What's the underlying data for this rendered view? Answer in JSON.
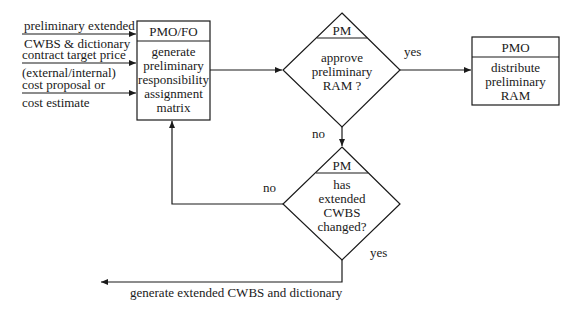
{
  "inputs": [
    {
      "line1": "preliminary extended",
      "line2": "CWBS & dictionary"
    },
    {
      "line1": "contract target price",
      "line2": "(external/internal)"
    },
    {
      "line1": "cost proposal or",
      "line2": "cost estimate"
    }
  ],
  "process_generate": {
    "actor": "PMO/FO",
    "lines": [
      "generate",
      "preliminary",
      "responsibility",
      "assignment",
      "matrix"
    ]
  },
  "decision_approve": {
    "actor": "PM",
    "lines": [
      "approve",
      "preliminary",
      "RAM ?"
    ],
    "yes_label": "yes",
    "no_label": "no"
  },
  "process_distribute": {
    "actor": "PMO",
    "lines": [
      "distribute",
      "preliminary",
      "RAM"
    ]
  },
  "decision_changed": {
    "actor": "PM",
    "lines": [
      "has",
      "extended",
      "CWBS",
      "changed?"
    ],
    "yes_label": "yes",
    "no_label": "no"
  },
  "output": {
    "label": "generate extended CWBS and dictionary"
  }
}
